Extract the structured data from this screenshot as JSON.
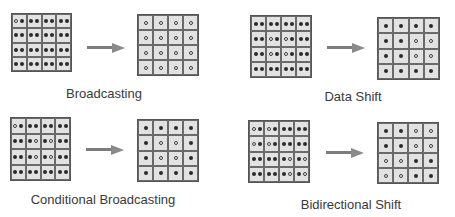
{
  "panels": [
    {
      "label": "Broadcasting",
      "source": [
        [
          "of",
          "ff",
          "ff",
          "ff"
        ],
        [
          "ff",
          "ff",
          "ff",
          "ff"
        ],
        [
          "ff",
          "ff",
          "ff",
          "ff"
        ],
        [
          "ff",
          "ff",
          "ff",
          "ff"
        ]
      ],
      "result": [
        [
          "o",
          "o",
          "o",
          "o"
        ],
        [
          "o",
          "o",
          "o",
          "o"
        ],
        [
          "o",
          "o",
          "o",
          "o"
        ],
        [
          "o",
          "o",
          "o",
          "o"
        ]
      ],
      "layout": {
        "src": [
          11,
          13,
          61,
          59
        ],
        "dst": [
          137,
          14,
          62,
          62
        ],
        "arrow": [
          87,
          43,
          38
        ],
        "label": [
          104,
          86
        ]
      }
    },
    {
      "label": "Data Shift",
      "source": [
        [
          "ff",
          "ff",
          "ff",
          "ff"
        ],
        [
          "ff",
          "of",
          "of",
          "ff"
        ],
        [
          "ff",
          "of",
          "of",
          "ff"
        ],
        [
          "ff",
          "ff",
          "ff",
          "ff"
        ]
      ],
      "result": [
        [
          "f",
          "f",
          "f",
          "f"
        ],
        [
          "f",
          "f",
          "o",
          "o"
        ],
        [
          "f",
          "f",
          "o",
          "o"
        ],
        [
          "f",
          "f",
          "f",
          "f"
        ]
      ],
      "layout": {
        "src": [
          250,
          15,
          62,
          63
        ],
        "dst": [
          377,
          17,
          63,
          63
        ],
        "arrow": [
          327,
          43,
          38
        ],
        "label": [
          353,
          89
        ]
      }
    },
    {
      "label": "Conditional Broadcasting",
      "source": [
        [
          "of",
          "ff",
          "ff",
          "ff"
        ],
        [
          "ff",
          "fo",
          "fo",
          "ff"
        ],
        [
          "ff",
          "fo",
          "fo",
          "ff"
        ],
        [
          "ff",
          "ff",
          "ff",
          "ff"
        ]
      ],
      "result": [
        [
          "f",
          "f",
          "f",
          "f"
        ],
        [
          "f",
          "o",
          "o",
          "f"
        ],
        [
          "f",
          "o",
          "o",
          "f"
        ],
        [
          "f",
          "f",
          "f",
          "f"
        ]
      ],
      "layout": {
        "src": [
          10,
          117,
          61,
          64
        ],
        "dst": [
          137,
          119,
          62,
          63
        ],
        "arrow": [
          86,
          145,
          38
        ],
        "label": [
          103,
          192
        ]
      }
    },
    {
      "label": "Bidirectional Shift",
      "source": [
        [
          "of",
          "of",
          "ff",
          "ff"
        ],
        [
          "of",
          "of",
          "ff",
          "ff"
        ],
        [
          "ff",
          "ff",
          "fo",
          "fo"
        ],
        [
          "ff",
          "ff",
          "fo",
          "fo"
        ]
      ],
      "result": [
        [
          "f",
          "f",
          "o",
          "o"
        ],
        [
          "f",
          "f",
          "o",
          "o"
        ],
        [
          "o",
          "o",
          "f",
          "f"
        ],
        [
          "o",
          "o",
          "f",
          "f"
        ]
      ],
      "layout": {
        "src": [
          248,
          120,
          62,
          63
        ],
        "dst": [
          377,
          122,
          62,
          62
        ],
        "arrow": [
          326,
          148,
          38
        ],
        "label": [
          351,
          197
        ]
      }
    }
  ],
  "legend": {
    "filled": "active element (●)",
    "hollow": "target element (○)"
  },
  "colors": {
    "cell_fill": "#e2e2e2",
    "grid_line": "#6a6a6a",
    "dot": "#2a2a2a",
    "arrow": "#7d7d7d"
  }
}
